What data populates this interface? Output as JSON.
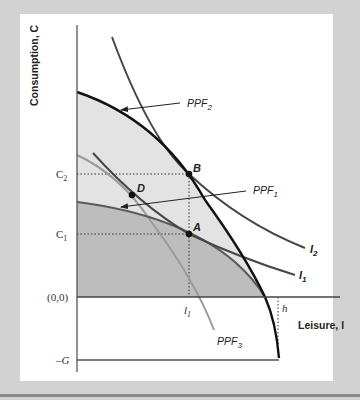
{
  "figure": {
    "y_axis_label": "Consumption, C",
    "x_axis_label": "Leisure, l",
    "tick_labels": {
      "c2": "C",
      "c2_sub": "2",
      "c1": "C",
      "c1_sub": "1",
      "origin": "(0,0)",
      "neg_g": "–G",
      "l1": "l",
      "l1_sub": "1",
      "h": "h"
    },
    "points": {
      "a": "A",
      "b": "B",
      "d": "D"
    },
    "curve_labels": {
      "ppf2": "PPF",
      "ppf2_sub": "2",
      "ppf1": "PPF",
      "ppf1_sub": "1",
      "ppf3": "PPF",
      "ppf3_sub": "3",
      "i2": "I",
      "i2_sub": "2",
      "i1": "I",
      "i1_sub": "1"
    },
    "colors": {
      "background": "#d2d2d2",
      "panel": "#ffffff",
      "ppf2_fill": "#e3e3e3",
      "ppf1_fill": "#bdbdbd",
      "ppf2_line": "#111111",
      "ppf1_line": "#555555",
      "ppf3_line": "#999999",
      "indifference_line": "#444444"
    }
  }
}
